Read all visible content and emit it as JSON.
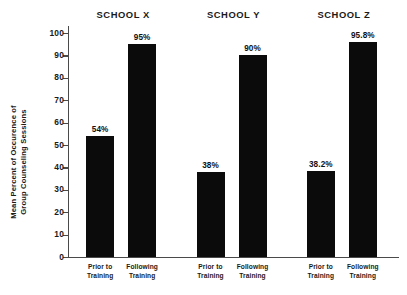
{
  "chart_data": {
    "type": "bar",
    "title": "",
    "xlabel": "",
    "ylabel_line1": "Mean Percent of Occurence of",
    "ylabel_line2": "Group Counseling Sessions",
    "ylim": [
      0,
      100
    ],
    "yticks": [
      0,
      10,
      20,
      30,
      40,
      50,
      60,
      70,
      80,
      90,
      100
    ],
    "ytick_labels": [
      "0",
      "10",
      "20",
      "30",
      "40",
      "50",
      "60",
      "70",
      "80",
      "90",
      "100"
    ],
    "grid": false,
    "legend": "none",
    "bar_color": "#0b0b0b",
    "groups": [
      {
        "name": "SCHOOL X",
        "bars": [
          {
            "category_line1": "Prior to",
            "category_line2": "Training",
            "value": 54,
            "label": "54%"
          },
          {
            "category_line1": "Following",
            "category_line2": "Training",
            "value": 95,
            "label": "95%"
          }
        ]
      },
      {
        "name": "SCHOOL Y",
        "bars": [
          {
            "category_line1": "Prior to",
            "category_line2": "Training",
            "value": 38,
            "label": "38%"
          },
          {
            "category_line1": "Following",
            "category_line2": "Training",
            "value": 90,
            "label": "90%"
          }
        ]
      },
      {
        "name": "SCHOOL Z",
        "bars": [
          {
            "category_line1": "Prior to",
            "category_line2": "Training",
            "value": 38.2,
            "label": "38.2%"
          },
          {
            "category_line1": "Following",
            "category_line2": "Training",
            "value": 95.8,
            "label": "95.8%"
          }
        ]
      }
    ]
  }
}
